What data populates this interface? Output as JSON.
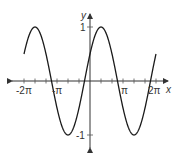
{
  "chart_data": {
    "type": "line",
    "title": "",
    "function": "y = sin(x + π/6)",
    "xlabel": "x",
    "ylabel": "y",
    "xlim": [
      -6.2832,
      6.2832
    ],
    "ylim": [
      -1,
      1
    ],
    "x_tick_labels": [
      "-2π",
      "-π",
      "π",
      "2π"
    ],
    "y_tick_labels": [
      "1",
      "-1"
    ],
    "x_minor_tick_step": "π/3",
    "grid": false,
    "legend": null,
    "series": [
      {
        "name": "sin(x + π/6)",
        "x": [
          -6.2832,
          -5.7596,
          -4.1888,
          -2.618,
          -1.0472,
          -0.5236,
          0,
          1.0472,
          2.618,
          4.1888,
          5.7596,
          6.2832
        ],
        "y": [
          0.5,
          0,
          1,
          0,
          -1,
          0,
          0.5,
          1,
          0,
          -1,
          0,
          0.5
        ]
      }
    ],
    "colors": {
      "curve": "#1a1a1a",
      "axes": "#333333"
    }
  },
  "labels": {
    "x_axis": "x",
    "y_axis": "y",
    "neg_two_pi": "-2π",
    "neg_pi": "-π",
    "pi": "π",
    "two_pi": "2π",
    "y_one": "1",
    "y_neg_one": "-1"
  }
}
